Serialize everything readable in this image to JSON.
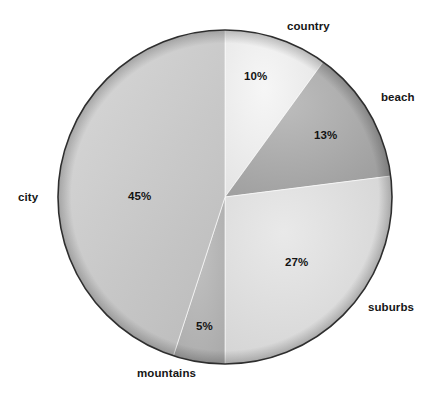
{
  "chart_data": {
    "type": "pie",
    "title": "",
    "categories": [
      "country",
      "beach",
      "suburbs",
      "mountains",
      "city"
    ],
    "values": [
      10,
      13,
      27,
      5,
      45
    ],
    "value_labels": [
      "10%",
      "13%",
      "27%",
      "5%",
      "45%"
    ],
    "unit": "%",
    "start_angle_deg": 0,
    "direction": "clockwise",
    "legend": "none",
    "grid": false,
    "slices": [
      {
        "label": "country",
        "value": 10,
        "value_label": "10%",
        "color": "#eeeeee",
        "color_dark": "#e2e2e2"
      },
      {
        "label": "beach",
        "value": 13,
        "value_label": "13%",
        "color": "#b3b3b3",
        "color_dark": "#a2a2a2"
      },
      {
        "label": "suburbs",
        "value": 27,
        "value_label": "27%",
        "color": "#e0e0e0",
        "color_dark": "#cfcfcf"
      },
      {
        "label": "mountains",
        "value": 5,
        "value_label": "5%",
        "color": "#b9b9b9",
        "color_dark": "#a8a8a8"
      },
      {
        "label": "city",
        "value": 45,
        "value_label": "45%",
        "color": "#cbcbcb",
        "color_dark": "#b5b5b5"
      }
    ],
    "outline_color": "#2e2e2e"
  }
}
